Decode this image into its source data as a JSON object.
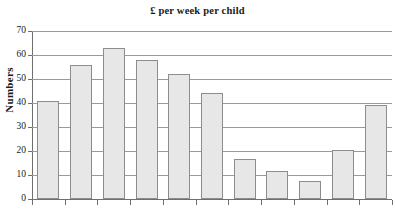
{
  "chart_data": {
    "type": "bar",
    "title": "£ per week per child",
    "xlabel": "",
    "ylabel": "Numbers",
    "ylim": [
      0,
      70
    ],
    "ytick_labels": [
      "70",
      "60",
      "50",
      "40",
      "30",
      "20",
      "10",
      "0"
    ],
    "ytick_values": [
      70,
      60,
      50,
      40,
      30,
      20,
      10,
      0
    ],
    "grid": true,
    "legend": "none",
    "categories": [
      "",
      "",
      "",
      "",
      "",
      "",
      "",
      "",
      "",
      "",
      ""
    ],
    "values": [
      41,
      56,
      63,
      58,
      52,
      44,
      16.5,
      11.5,
      7.5,
      20.5,
      39
    ],
    "bar_fill_color": "#e7e7e7",
    "bar_edge_color": "#8d8d8d",
    "axis_color": "#6f6f6f",
    "gridline_color": "#9a9a9a"
  }
}
